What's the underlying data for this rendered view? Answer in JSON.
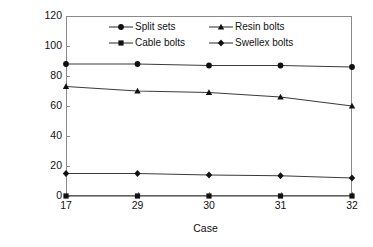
{
  "chart_data": {
    "type": "line",
    "title": "",
    "xlabel": "Case",
    "ylabel": "Bond shear failure (%)",
    "categories": [
      "17",
      "29",
      "30",
      "31",
      "32"
    ],
    "x": [
      17,
      29,
      30,
      31,
      32
    ],
    "ylim": [
      0,
      120
    ],
    "yticks": [
      0,
      20,
      40,
      60,
      80,
      100,
      120
    ],
    "ytick_labels": [
      "0",
      "20",
      "40",
      "60",
      "80",
      "100",
      "120"
    ],
    "grid": false,
    "legend_position": "inside-top-center",
    "series": [
      {
        "name": "Split sets",
        "marker": "filled-circle",
        "color": "#111111",
        "values": [
          88,
          88,
          87,
          87,
          86
        ]
      },
      {
        "name": "Resin bolts",
        "marker": "filled-triangle",
        "color": "#111111",
        "values": [
          73,
          70,
          69,
          66,
          60
        ]
      },
      {
        "name": "Cable bolts",
        "marker": "filled-square",
        "color": "#111111",
        "values": [
          0,
          0,
          0,
          0,
          0
        ]
      },
      {
        "name": "Swellex bolts",
        "marker": "filled-diamond",
        "color": "#111111",
        "values": [
          15,
          15,
          14,
          13.5,
          12
        ]
      }
    ],
    "legend_order": [
      "Split sets",
      "Resin bolts",
      "Cable bolts",
      "Swellex bolts"
    ]
  },
  "colors": {
    "axis": "#8a8a8a",
    "line": "#3b3b3b",
    "marker": "#111111",
    "text": "#111111",
    "background": "#ffffff"
  }
}
